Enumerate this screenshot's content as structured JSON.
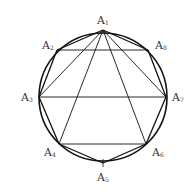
{
  "diagram": {
    "type": "regular octagon inscribed in circle",
    "circle": {
      "cx": 103,
      "cy": 97,
      "r": 64
    },
    "stroke_color": "#111111",
    "vertices": [
      {
        "id": "A1",
        "letter": "A",
        "sub": "1",
        "x": 103,
        "y": 30,
        "lx": 97,
        "ly": 15
      },
      {
        "id": "A2",
        "letter": "A",
        "sub": "2",
        "x": 57,
        "y": 50,
        "lx": 42,
        "ly": 40
      },
      {
        "id": "A3",
        "letter": "A",
        "sub": "3",
        "x": 39,
        "y": 97,
        "lx": 21,
        "ly": 92
      },
      {
        "id": "A4",
        "letter": "A",
        "sub": "4",
        "x": 59,
        "y": 144,
        "lx": 44,
        "ly": 147
      },
      {
        "id": "A5",
        "letter": "A",
        "sub": "5",
        "x": 103,
        "y": 163,
        "lx": 97,
        "ly": 172
      },
      {
        "id": "A6",
        "letter": "A",
        "sub": "6",
        "x": 146,
        "y": 144,
        "lx": 152,
        "ly": 147
      },
      {
        "id": "A7",
        "letter": "A",
        "sub": "7",
        "x": 166,
        "y": 97,
        "lx": 172,
        "ly": 92
      },
      {
        "id": "A8",
        "letter": "A",
        "sub": "8",
        "x": 148,
        "y": 50,
        "lx": 155,
        "ly": 40
      }
    ],
    "segments": [
      [
        "A1",
        "A2"
      ],
      [
        "A2",
        "A3"
      ],
      [
        "A3",
        "A4"
      ],
      [
        "A4",
        "A5"
      ],
      [
        "A5",
        "A6"
      ],
      [
        "A6",
        "A7"
      ],
      [
        "A7",
        "A8"
      ],
      [
        "A8",
        "A1"
      ],
      [
        "A2",
        "A8"
      ],
      [
        "A3",
        "A7"
      ],
      [
        "A4",
        "A6"
      ],
      [
        "A1",
        "A3"
      ],
      [
        "A1",
        "A4"
      ],
      [
        "A1",
        "A6"
      ],
      [
        "A1",
        "A7"
      ]
    ]
  }
}
